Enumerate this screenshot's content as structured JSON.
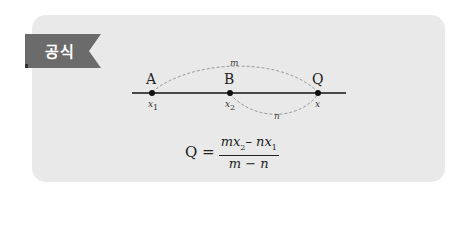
{
  "tab": {
    "label": "공식",
    "color": "#6b6b6b"
  },
  "card": {
    "background": "#e9e9e9"
  },
  "diagram": {
    "points": [
      {
        "name": "A",
        "coord": "x",
        "sub": "1"
      },
      {
        "name": "B",
        "coord": "x",
        "sub": "2"
      },
      {
        "name": "Q",
        "coord": "x",
        "sub": ""
      }
    ],
    "arc_labels": {
      "upper": "m",
      "lower": "n"
    }
  },
  "formula": {
    "lhs": "Q =",
    "numerator": {
      "t1": "mx",
      "s1": "2",
      "mid": "– nx",
      "s2": "1"
    },
    "denominator": "m − n"
  }
}
